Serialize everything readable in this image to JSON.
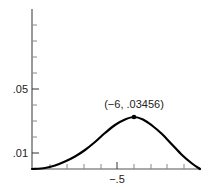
{
  "chart_data": {
    "type": "line",
    "title": "",
    "xlabel": "",
    "ylabel": "",
    "grid": false,
    "legend": null,
    "x_tick_labels": [
      {
        "label": "−.5",
        "px": 117
      }
    ],
    "y_tick_labels": [
      {
        "label": ".05",
        "py": 89
      },
      {
        "label": ".01",
        "py": 153
      }
    ],
    "x_minor_ticks_px": [
      50,
      67,
      84,
      101,
      117,
      134,
      151,
      167,
      184
    ],
    "y_minor_ticks_px": [
      25,
      41,
      57,
      73,
      89,
      105,
      121,
      137,
      153
    ],
    "axis": {
      "origin_px": [
        32,
        169
      ],
      "y_top_px": 9,
      "x_end_px": 201
    },
    "series": [
      {
        "name": "curve",
        "color": "#000000",
        "points_px": [
          [
            32,
            169
          ],
          [
            45,
            168
          ],
          [
            55,
            165.5
          ],
          [
            65,
            161.5
          ],
          [
            75,
            156.5
          ],
          [
            85,
            150
          ],
          [
            95,
            142
          ],
          [
            105,
            133
          ],
          [
            115,
            125
          ],
          [
            125,
            119.5
          ],
          [
            134,
            117
          ],
          [
            143,
            119.5
          ],
          [
            152,
            125.5
          ],
          [
            162,
            134
          ],
          [
            172,
            144.5
          ],
          [
            182,
            155
          ],
          [
            192,
            163.5
          ],
          [
            200,
            169
          ]
        ]
      }
    ],
    "annotations": [
      {
        "text": "(−6, .03456)",
        "point_px": [
          134,
          117
        ],
        "label_px": [
          134,
          108
        ]
      }
    ]
  }
}
